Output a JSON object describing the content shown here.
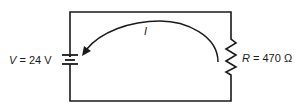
{
  "diagram": {
    "type": "circuit",
    "components": [
      {
        "kind": "battery",
        "symbol": "V",
        "value": "24 V"
      },
      {
        "kind": "resistor",
        "symbol": "R",
        "value": "470 Ω"
      }
    ],
    "current_label": "I",
    "current_direction": "counterclockwise-into-battery-positive"
  },
  "labels": {
    "battery_symbol": "V",
    "battery_eq": " = 24 V",
    "resistor_symbol": "R",
    "resistor_eq": " = 470 Ω",
    "current": "I"
  },
  "colors": {
    "wire": "#1a1a1a",
    "background": "#ffffff"
  }
}
